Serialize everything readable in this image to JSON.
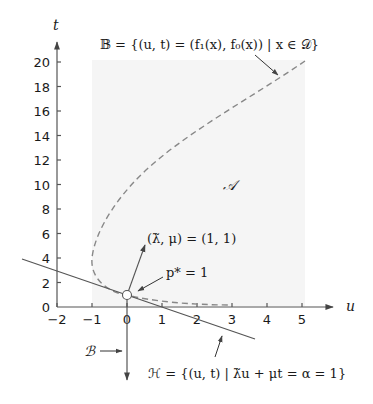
{
  "figure": {
    "axes": {
      "x_label": "u",
      "y_label": "t",
      "x_ticks": [
        "−2",
        "−1",
        "0",
        "1",
        "2",
        "3",
        "4",
        "5"
      ],
      "y_ticks": [
        "0",
        "2",
        "4",
        "6",
        "8",
        "10",
        "12",
        "14",
        "16",
        "18",
        "20"
      ]
    },
    "annotations": {
      "set_B_curve": "𝔹 = {(u, t) = (f₁(x), f₀(x)) | x ∈ 𝒟}",
      "set_A": "𝒜",
      "normal_vector": "(λ̃, μ) = (1, 1)",
      "optimum": "p* = 1",
      "set_B_ray": "ℬ",
      "hyperplane": "ℋ = {(u, t) | λ̃u + μt = α = 1}"
    },
    "colors": {
      "axis": "#555555",
      "curve": "#888888",
      "region_fill": "#f5f5f5",
      "hyperplane": "#555555"
    }
  }
}
